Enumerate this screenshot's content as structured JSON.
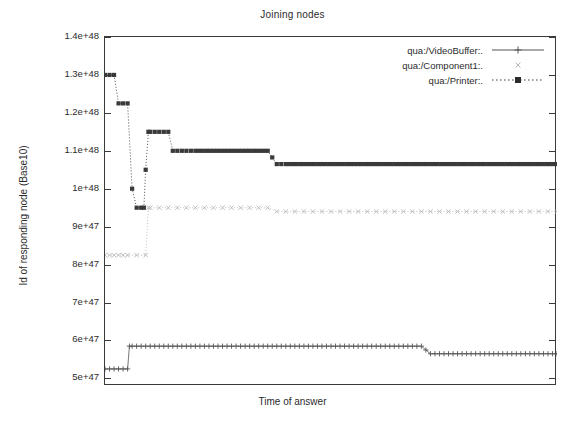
{
  "chart_data": {
    "type": "line",
    "title": "Joining nodes",
    "xlabel": "Time of answer",
    "ylabel": "Id of responding node (Base10)",
    "grid": false,
    "legend_position": "top-right-inside",
    "ylim": [
      4.8e+47,
      1.4e+48
    ],
    "xlim": [
      0,
      100
    ],
    "yticks": [
      {
        "value": 5e+47,
        "label": "5e+47"
      },
      {
        "value": 6e+47,
        "label": "6e+47"
      },
      {
        "value": 7e+47,
        "label": "7e+47"
      },
      {
        "value": 8e+47,
        "label": "8e+47"
      },
      {
        "value": 9e+47,
        "label": "9e+47"
      },
      {
        "value": 1e+48,
        "label": "1e+48"
      },
      {
        "value": 1.1e+48,
        "label": "1.1e+48"
      },
      {
        "value": 1.2e+48,
        "label": "1.2e+48"
      },
      {
        "value": 1.3e+48,
        "label": "1.3e+48"
      },
      {
        "value": 1.4e+48,
        "label": "1.4e+48"
      }
    ],
    "xticks": [],
    "series": [
      {
        "name": "qua:/VideoBuffer:.",
        "marker": "plus",
        "linestyle": "solid",
        "color": "#555555",
        "x": [
          0.0,
          1.0,
          2.0,
          3.0,
          4.0,
          5.0,
          5.4,
          6.0,
          8.0,
          10.0,
          12.0,
          14.0,
          16.0,
          18.0,
          20.0,
          24.0,
          28.0,
          32.0,
          36.0,
          40.0,
          44.0,
          48.0,
          52.0,
          56.0,
          60.0,
          64.0,
          68.0,
          70.0,
          72.0,
          74.0,
          76.0,
          78.0,
          80.0,
          84.0,
          88.0,
          92.0,
          96.0,
          100.0
        ],
        "y": [
          5.25e+47,
          5.25e+47,
          5.25e+47,
          5.25e+47,
          5.25e+47,
          5.25e+47,
          5.85e+47,
          5.85e+47,
          5.85e+47,
          5.85e+47,
          5.85e+47,
          5.85e+47,
          5.85e+47,
          5.85e+47,
          5.85e+47,
          5.85e+47,
          5.85e+47,
          5.85e+47,
          5.85e+47,
          5.85e+47,
          5.85e+47,
          5.85e+47,
          5.85e+47,
          5.85e+47,
          5.85e+47,
          5.85e+47,
          5.85e+47,
          5.85e+47,
          5.65e+47,
          5.65e+47,
          5.65e+47,
          5.65e+47,
          5.65e+47,
          5.65e+47,
          5.65e+47,
          5.65e+47,
          5.65e+47,
          5.65e+47
        ]
      },
      {
        "name": "qua:/Component1:.",
        "marker": "cross",
        "linestyle": "dotted",
        "color": "#b9b9b9",
        "x": [
          0.0,
          1.0,
          2.0,
          3.0,
          4.0,
          5.0,
          9.0,
          9.6,
          10.0,
          12.0,
          14.0,
          16.0,
          18.0,
          20.0,
          24.0,
          28.0,
          32.0,
          36.0,
          38.0,
          40.0,
          44.0,
          48.0,
          52.0,
          56.0,
          60.0,
          64.0,
          68.0,
          72.0,
          76.0,
          80.0,
          84.0,
          88.0,
          92.0,
          96.0,
          100.0
        ],
        "y": [
          8.25e+47,
          8.25e+47,
          8.25e+47,
          8.25e+47,
          8.25e+47,
          8.25e+47,
          8.25e+47,
          9.5e+47,
          9.5e+47,
          9.5e+47,
          9.5e+47,
          9.5e+47,
          9.5e+47,
          9.5e+47,
          9.5e+47,
          9.5e+47,
          9.5e+47,
          9.5e+47,
          9.4e+47,
          9.4e+47,
          9.4e+47,
          9.4e+47,
          9.4e+47,
          9.4e+47,
          9.4e+47,
          9.4e+47,
          9.4e+47,
          9.4e+47,
          9.4e+47,
          9.4e+47,
          9.4e+47,
          9.4e+47,
          9.4e+47,
          9.4e+47,
          9.4e+47
        ]
      },
      {
        "name": "qua:/Printer:.",
        "marker": "filled-square",
        "linestyle": "dotted",
        "color": "#3a3a3a",
        "x": [
          0.0,
          1.0,
          2.0,
          3.0,
          4.0,
          5.0,
          6.0,
          7.0,
          8.0,
          8.6,
          9.0,
          9.6,
          10.0,
          12.0,
          14.0,
          15.0,
          16.0,
          18.0,
          20.0,
          24.0,
          28.0,
          32.0,
          36.0,
          38.0,
          40.0,
          44.0,
          48.0,
          52.0,
          56.0,
          60.0,
          64.0,
          68.0,
          72.0,
          76.0,
          80.0,
          84.0,
          88.0,
          92.0,
          96.0,
          100.0
        ],
        "y": [
          1.3e+48,
          1.3e+48,
          1.3e+48,
          1.225e+48,
          1.225e+48,
          1.225e+48,
          1e+48,
          9.5e+47,
          9.5e+47,
          9.5e+47,
          1.05e+48,
          1.15e+48,
          1.15e+48,
          1.15e+48,
          1.15e+48,
          1.1e+48,
          1.1e+48,
          1.1e+48,
          1.1e+48,
          1.1e+48,
          1.1e+48,
          1.1e+48,
          1.1e+48,
          1.065e+48,
          1.065e+48,
          1.065e+48,
          1.065e+48,
          1.065e+48,
          1.065e+48,
          1.065e+48,
          1.065e+48,
          1.065e+48,
          1.065e+48,
          1.065e+48,
          1.065e+48,
          1.065e+48,
          1.065e+48,
          1.065e+48,
          1.065e+48,
          1.065e+48
        ]
      }
    ]
  },
  "legend": {
    "items": [
      {
        "label": "qua:/VideoBuffer:.",
        "key": "line-plus-key"
      },
      {
        "label": "qua:/Component1:.",
        "key": "sparse-cross-key"
      },
      {
        "label": "qua:/Printer:.",
        "key": "dotted-square-key"
      }
    ]
  },
  "colors": {
    "frame": "#3a3a3a",
    "text": "#2b2b2b",
    "background": "#ffffff"
  }
}
